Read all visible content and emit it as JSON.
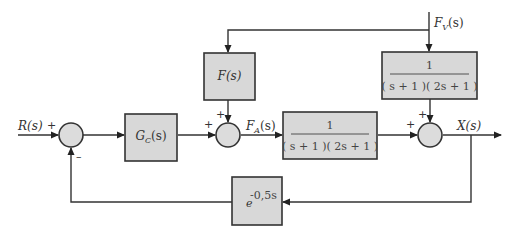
{
  "diagram": {
    "type": "control-block-diagram",
    "signals": {
      "input": "R(s)",
      "actuator": "F_A(s)",
      "actuator_main": "F",
      "actuator_sub": "A",
      "actuator_arg": "(s)",
      "disturbance": "F_V(s)",
      "disturbance_main": "F",
      "disturbance_sub": "V",
      "disturbance_arg": "(s)",
      "output": "X(s)"
    },
    "blocks": {
      "controller": {
        "main": "G",
        "sub": "C",
        "arg": "(s)"
      },
      "feedforward": {
        "label": "F(s)"
      },
      "plant": {
        "numerator": "1",
        "denominator": "( s + 1 )( 2s + 1 )"
      },
      "disturbance_tf": {
        "numerator": "1",
        "denominator": "( s + 1 )( 2s + 1 )"
      },
      "delay": {
        "base": "e",
        "exponent": "-0,5s"
      }
    },
    "summing_junctions": {
      "sum1": {
        "signs": [
          "+",
          "–"
        ]
      },
      "sum2": {
        "signs": [
          "+",
          "+"
        ]
      },
      "sum3": {
        "signs": [
          "+",
          "+"
        ]
      }
    },
    "colors": {
      "block_fill": "#d8d8d8",
      "stroke": "#333333",
      "background": "#ffffff"
    }
  }
}
